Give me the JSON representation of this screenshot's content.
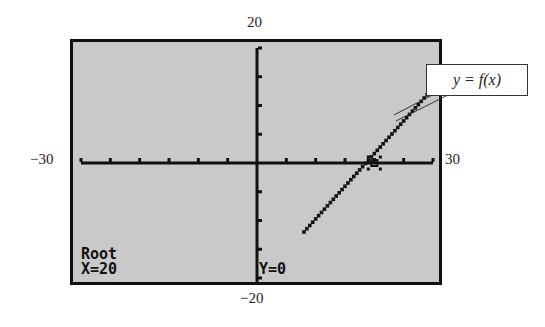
{
  "chart_data": {
    "type": "line",
    "title": "",
    "xlabel": "",
    "ylabel": "",
    "xlim": [
      -30,
      30
    ],
    "ylim": [
      -20,
      20
    ],
    "xticks_step": 5,
    "yticks_step": 5,
    "grid": false,
    "series": [
      {
        "name": "y = f(x)",
        "x": [
          8,
          30
        ],
        "y": [
          -12,
          13
        ]
      }
    ],
    "annotations": [
      {
        "text": "y = f(x)",
        "type": "callout"
      },
      {
        "text": "Root",
        "position": "bottom-left"
      },
      {
        "text": "X=20",
        "position": "bottom-left"
      },
      {
        "text": "Y=0",
        "position": "bottom-center"
      }
    ],
    "root": {
      "x": 20,
      "y": 0
    }
  },
  "window": {
    "xmin_label": "−30",
    "xmax_label": "30",
    "ymax_label": "20",
    "ymin_label": "−20"
  },
  "screen": {
    "mode_label": "Root",
    "x_readout": "X=20",
    "y_readout": "Y=0"
  },
  "callout": {
    "label": "y = f(x)"
  },
  "colors": {
    "screen_bg": "#c9c9c9",
    "ink": "#111111"
  }
}
